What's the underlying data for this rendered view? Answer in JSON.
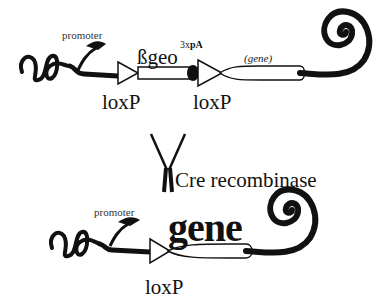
{
  "diagram": {
    "before": {
      "promoter_label": "promoter",
      "cassette_label": "ßgeo",
      "polyA_prefix": "3x",
      "polyA_label": "pA",
      "gene_label": "(gene)",
      "loxp_left": "loxP",
      "loxp_right": "loxP"
    },
    "enzyme": {
      "label": "Cre recombinase",
      "icon": "y-shaped-enzyme-icon"
    },
    "after": {
      "promoter_label": "promoter",
      "gene_label": "gene",
      "loxp_label": "loxP"
    }
  }
}
